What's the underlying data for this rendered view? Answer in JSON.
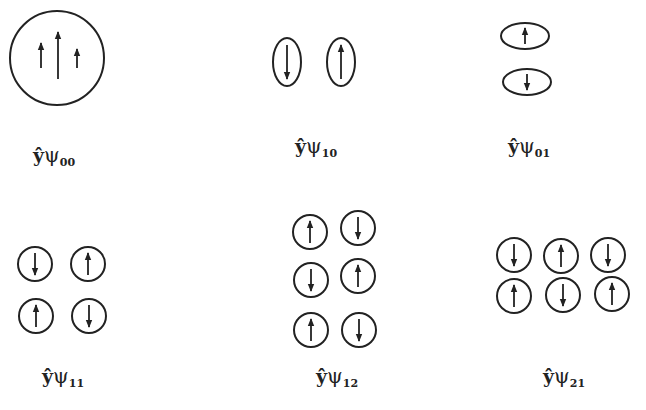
{
  "figure": {
    "stroke_color": "#222222",
    "background": "#ffffff",
    "panels": [
      {
        "id": "psi00",
        "label": {
          "prefix": "ŷ",
          "symbol": "ψ",
          "subscript": "00",
          "x": 33,
          "y": 145
        },
        "shapes": [
          {
            "type": "ellipse",
            "cx": 57,
            "cy": 58,
            "rx": 47,
            "ry": 47,
            "arrows": []
          }
        ],
        "free_arrows": [
          {
            "x": 41,
            "y1": 68,
            "y2": 43,
            "dir": "up"
          },
          {
            "x": 58,
            "y1": 79,
            "y2": 32,
            "dir": "up"
          },
          {
            "x": 77,
            "y1": 68,
            "y2": 49,
            "dir": "up"
          }
        ]
      },
      {
        "id": "psi10",
        "label": {
          "prefix": "ŷ",
          "symbol": "ψ",
          "subscript": "10",
          "x": 295,
          "y": 136
        },
        "shapes": [
          {
            "type": "ellipse",
            "cx": 287,
            "cy": 62,
            "rx": 14,
            "ry": 24,
            "arrow": {
              "dir": "down",
              "len": 34
            }
          },
          {
            "type": "ellipse",
            "cx": 341,
            "cy": 62,
            "rx": 14,
            "ry": 24,
            "arrow": {
              "dir": "up",
              "len": 34
            }
          }
        ]
      },
      {
        "id": "psi01",
        "label": {
          "prefix": "ŷ",
          "symbol": "ψ",
          "subscript": "01",
          "x": 508,
          "y": 136
        },
        "shapes": [
          {
            "type": "ellipse",
            "cx": 525,
            "cy": 36,
            "rx": 24,
            "ry": 13,
            "arrow": {
              "dir": "up",
              "len": 16
            }
          },
          {
            "type": "ellipse",
            "cx": 527,
            "cy": 82,
            "rx": 24,
            "ry": 13,
            "arrow": {
              "dir": "down",
              "len": 16
            }
          }
        ]
      },
      {
        "id": "psi11",
        "label": {
          "prefix": "ŷ",
          "symbol": "ψ",
          "subscript": "11",
          "x": 42,
          "y": 366
        },
        "shapes": [
          {
            "type": "ellipse",
            "cx": 35,
            "cy": 264,
            "rx": 17,
            "ry": 17,
            "arrow": {
              "dir": "down",
              "len": 22
            }
          },
          {
            "type": "ellipse",
            "cx": 88,
            "cy": 264,
            "rx": 17,
            "ry": 17,
            "arrow": {
              "dir": "up",
              "len": 22
            }
          },
          {
            "type": "ellipse",
            "cx": 36,
            "cy": 316,
            "rx": 17,
            "ry": 17,
            "arrow": {
              "dir": "up",
              "len": 22
            }
          },
          {
            "type": "ellipse",
            "cx": 89,
            "cy": 316,
            "rx": 17,
            "ry": 17,
            "arrow": {
              "dir": "down",
              "len": 22
            }
          }
        ]
      },
      {
        "id": "psi12",
        "label": {
          "prefix": "ŷ",
          "symbol": "ψ",
          "subscript": "12",
          "x": 316,
          "y": 366
        },
        "shapes": [
          {
            "type": "ellipse",
            "cx": 310,
            "cy": 232,
            "rx": 17,
            "ry": 17,
            "arrow": {
              "dir": "up",
              "len": 22
            }
          },
          {
            "type": "ellipse",
            "cx": 358,
            "cy": 228,
            "rx": 17,
            "ry": 17,
            "arrow": {
              "dir": "down",
              "len": 22
            }
          },
          {
            "type": "ellipse",
            "cx": 311,
            "cy": 280,
            "rx": 17,
            "ry": 17,
            "arrow": {
              "dir": "down",
              "len": 22
            }
          },
          {
            "type": "ellipse",
            "cx": 358,
            "cy": 276,
            "rx": 17,
            "ry": 17,
            "arrow": {
              "dir": "up",
              "len": 22
            }
          },
          {
            "type": "ellipse",
            "cx": 311,
            "cy": 330,
            "rx": 17,
            "ry": 17,
            "arrow": {
              "dir": "up",
              "len": 22
            }
          },
          {
            "type": "ellipse",
            "cx": 359,
            "cy": 330,
            "rx": 17,
            "ry": 17,
            "arrow": {
              "dir": "down",
              "len": 22
            }
          }
        ]
      },
      {
        "id": "psi21",
        "label": {
          "prefix": "ŷ",
          "symbol": "ψ",
          "subscript": "21",
          "x": 543,
          "y": 366
        },
        "shapes": [
          {
            "type": "ellipse",
            "cx": 514,
            "cy": 255,
            "rx": 17,
            "ry": 17,
            "arrow": {
              "dir": "down",
              "len": 22
            }
          },
          {
            "type": "ellipse",
            "cx": 561,
            "cy": 256,
            "rx": 17,
            "ry": 17,
            "arrow": {
              "dir": "up",
              "len": 22
            }
          },
          {
            "type": "ellipse",
            "cx": 608,
            "cy": 255,
            "rx": 17,
            "ry": 17,
            "arrow": {
              "dir": "down",
              "len": 22
            }
          },
          {
            "type": "ellipse",
            "cx": 514,
            "cy": 296,
            "rx": 17,
            "ry": 17,
            "arrow": {
              "dir": "up",
              "len": 22
            }
          },
          {
            "type": "ellipse",
            "cx": 563,
            "cy": 295,
            "rx": 17,
            "ry": 17,
            "arrow": {
              "dir": "down",
              "len": 22
            }
          },
          {
            "type": "ellipse",
            "cx": 612,
            "cy": 294,
            "rx": 17,
            "ry": 17,
            "arrow": {
              "dir": "up",
              "len": 22
            }
          }
        ]
      }
    ]
  }
}
